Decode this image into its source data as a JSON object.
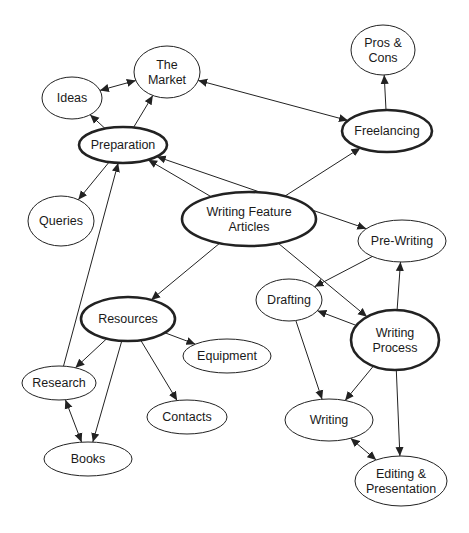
{
  "diagram": {
    "type": "concept-map",
    "colors": {
      "line": "#222222",
      "fill": "#ffffff",
      "text": "#1a1a1a",
      "background": "#ffffff"
    },
    "nodes": [
      {
        "id": "ideas",
        "lines": [
          "Ideas"
        ],
        "cx": 72,
        "cy": 98,
        "rx": 30,
        "ry": 21,
        "emphasis": false
      },
      {
        "id": "market",
        "lines": [
          "The",
          "Market"
        ],
        "cx": 167,
        "cy": 72,
        "rx": 33,
        "ry": 26,
        "emphasis": false
      },
      {
        "id": "pros",
        "lines": [
          "Pros &",
          "Cons"
        ],
        "cx": 383,
        "cy": 50,
        "rx": 32,
        "ry": 25,
        "emphasis": false
      },
      {
        "id": "preparation",
        "lines": [
          "Preparation"
        ],
        "cx": 123,
        "cy": 145,
        "rx": 44,
        "ry": 18,
        "emphasis": true
      },
      {
        "id": "freelancing",
        "lines": [
          "Freelancing"
        ],
        "cx": 387,
        "cy": 131,
        "rx": 45,
        "ry": 21,
        "emphasis": true
      },
      {
        "id": "queries",
        "lines": [
          "Queries"
        ],
        "cx": 61,
        "cy": 221,
        "rx": 33,
        "ry": 25,
        "emphasis": false
      },
      {
        "id": "wfa",
        "lines": [
          "Writing Feature",
          "Articles"
        ],
        "cx": 249,
        "cy": 219,
        "rx": 67,
        "ry": 27,
        "emphasis": true
      },
      {
        "id": "prewriting",
        "lines": [
          "Pre-Writing"
        ],
        "cx": 402,
        "cy": 241,
        "rx": 44,
        "ry": 21,
        "emphasis": false
      },
      {
        "id": "drafting",
        "lines": [
          "Drafting"
        ],
        "cx": 289,
        "cy": 300,
        "rx": 33,
        "ry": 21,
        "emphasis": false
      },
      {
        "id": "resources",
        "lines": [
          "Resources"
        ],
        "cx": 128,
        "cy": 319,
        "rx": 47,
        "ry": 22,
        "emphasis": true
      },
      {
        "id": "process",
        "lines": [
          "Writing",
          "Process"
        ],
        "cx": 395,
        "cy": 340,
        "rx": 44,
        "ry": 30,
        "emphasis": true
      },
      {
        "id": "equipment",
        "lines": [
          "Equipment"
        ],
        "cx": 227,
        "cy": 356,
        "rx": 44,
        "ry": 17,
        "emphasis": false
      },
      {
        "id": "research",
        "lines": [
          "Research"
        ],
        "cx": 59,
        "cy": 383,
        "rx": 37,
        "ry": 17,
        "emphasis": false
      },
      {
        "id": "contacts",
        "lines": [
          "Contacts"
        ],
        "cx": 187,
        "cy": 417,
        "rx": 40,
        "ry": 17,
        "emphasis": false
      },
      {
        "id": "writing",
        "lines": [
          "Writing"
        ],
        "cx": 329,
        "cy": 420,
        "rx": 44,
        "ry": 21,
        "emphasis": false
      },
      {
        "id": "books",
        "lines": [
          "Books"
        ],
        "cx": 88,
        "cy": 459,
        "rx": 44,
        "ry": 17,
        "emphasis": false
      },
      {
        "id": "editing",
        "lines": [
          "Editing &",
          "Presentation"
        ],
        "cx": 401,
        "cy": 481,
        "rx": 46,
        "ry": 25,
        "emphasis": false
      }
    ],
    "edges": [
      {
        "from": "ideas",
        "to": "market",
        "bidirectional": true
      },
      {
        "from": "preparation",
        "to": "ideas",
        "bidirectional": false
      },
      {
        "from": "preparation",
        "to": "market",
        "bidirectional": false
      },
      {
        "from": "market",
        "to": "freelancing",
        "bidirectional": true
      },
      {
        "from": "freelancing",
        "to": "pros",
        "bidirectional": false
      },
      {
        "from": "preparation",
        "to": "queries",
        "bidirectional": false
      },
      {
        "from": "preparation",
        "to": "prewriting",
        "bidirectional": true
      },
      {
        "from": "wfa",
        "to": "preparation",
        "bidirectional": false
      },
      {
        "from": "wfa",
        "to": "freelancing",
        "bidirectional": false
      },
      {
        "from": "wfa",
        "to": "resources",
        "bidirectional": false
      },
      {
        "from": "wfa",
        "to": "process",
        "bidirectional": false
      },
      {
        "from": "research",
        "to": "preparation",
        "bidirectional": false
      },
      {
        "from": "prewriting",
        "to": "drafting",
        "bidirectional": false
      },
      {
        "from": "process",
        "to": "prewriting",
        "bidirectional": false
      },
      {
        "from": "process",
        "to": "drafting",
        "bidirectional": false
      },
      {
        "from": "process",
        "to": "writing",
        "bidirectional": false
      },
      {
        "from": "process",
        "to": "editing",
        "bidirectional": false
      },
      {
        "from": "drafting",
        "to": "writing",
        "bidirectional": false
      },
      {
        "from": "writing",
        "to": "editing",
        "bidirectional": true
      },
      {
        "from": "resources",
        "to": "research",
        "bidirectional": false
      },
      {
        "from": "resources",
        "to": "equipment",
        "bidirectional": false
      },
      {
        "from": "resources",
        "to": "contacts",
        "bidirectional": false
      },
      {
        "from": "resources",
        "to": "books",
        "bidirectional": false
      },
      {
        "from": "research",
        "to": "books",
        "bidirectional": true
      }
    ]
  }
}
